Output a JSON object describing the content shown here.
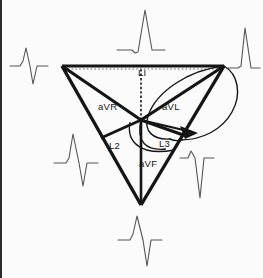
{
  "figure": {
    "background_color": "#fbfbfb",
    "line_color": "#151515",
    "trace_color": "#4a4a4a"
  },
  "lead_labels": {
    "l1": "LI",
    "avr": "aVR",
    "avl": "aVL",
    "l2": "L2",
    "l3": "L3",
    "avf": "aVF"
  },
  "leads": [
    {
      "id": "l1",
      "label": "LI",
      "label_x": 136,
      "label_y": 76,
      "axis": "lead-I"
    },
    {
      "id": "avr",
      "label": "aVR",
      "label_x": 96,
      "label_y": 110,
      "axis": "augmented-vector-right"
    },
    {
      "id": "avl",
      "label": "aVL",
      "label_x": 160,
      "label_y": 110,
      "axis": "augmented-vector-left"
    },
    {
      "id": "l2",
      "label": "L2",
      "label_x": 107,
      "label_y": 149,
      "axis": "lead-II"
    },
    {
      "id": "l3",
      "label": "L3",
      "label_x": 157,
      "label_y": 147,
      "axis": "lead-III"
    },
    {
      "id": "avf",
      "label": "aVF",
      "label_x": 137,
      "label_y": 167,
      "axis": "augmented-vector-foot"
    }
  ],
  "triangle": {
    "vertex_left": {
      "x": 60,
      "y": 66
    },
    "vertex_right": {
      "x": 222,
      "y": 66
    },
    "vertex_bottom": {
      "x": 139,
      "y": 205
    },
    "center": {
      "x": 139,
      "y": 120
    }
  },
  "vector_loop": {
    "description": "QRS vector loop ellipse with arrowhead indicating direction",
    "arrow_x": 188,
    "arrow_y": 130
  },
  "ecg_traces": [
    {
      "id": "trace-top",
      "position": "top",
      "x": 112,
      "y": 4,
      "morphology": "tall-positive-R"
    },
    {
      "id": "trace-upper-left",
      "position": "upper-left",
      "x": 4,
      "y": 48,
      "morphology": "small-r-deep-S"
    },
    {
      "id": "trace-upper-right",
      "position": "upper-right",
      "x": 216,
      "y": 24,
      "morphology": "tall-positive-R"
    },
    {
      "id": "trace-lower-left",
      "position": "lower-left",
      "x": 48,
      "y": 130,
      "morphology": "positive-R-with-S"
    },
    {
      "id": "trace-lower-right",
      "position": "lower-right",
      "x": 176,
      "y": 146,
      "morphology": "small-r-deep-S"
    },
    {
      "id": "trace-bottom",
      "position": "bottom",
      "x": 114,
      "y": 214,
      "morphology": "positive-R-deep-S"
    }
  ]
}
